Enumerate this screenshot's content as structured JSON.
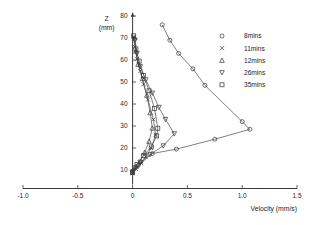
{
  "chart_data": {
    "type": "line",
    "title": "",
    "xlabel": "Velocity  (mm/s)",
    "ylabel": "Z",
    "ylabel_units": "(mm)",
    "xlim": [
      -1.0,
      1.5
    ],
    "ylim": [
      0,
      80
    ],
    "xticks": [
      -1.0,
      -0.5,
      0,
      0.5,
      1.0,
      1.5
    ],
    "xticklabels": [
      "-1.0",
      "-0.5",
      "0",
      "0.5",
      "1.0",
      "1.5"
    ],
    "yticks": [
      10,
      20,
      30,
      40,
      50,
      60,
      70,
      80
    ],
    "yticklabels": [
      "10",
      "20",
      "30",
      "40",
      "50",
      "60",
      "70",
      "80"
    ],
    "grid": false,
    "legend_position": "upper-right",
    "orientation": "x-is-velocity-y-is-height",
    "series": [
      {
        "name": "8mins",
        "marker": "circle",
        "x": [
          0.27,
          0.34,
          0.42,
          0.55,
          0.66,
          1.0,
          1.07,
          0.75,
          0.4,
          0.18,
          0.05,
          0.0
        ],
        "y": [
          76.0,
          69.0,
          63.0,
          56.0,
          48.5,
          32.0,
          28.5,
          24.0,
          19.5,
          17.5,
          12.0,
          9.5
        ]
      },
      {
        "name": "11mins",
        "marker": "cross",
        "x": [
          0.01,
          0.02,
          0.04,
          0.07,
          0.1,
          0.14,
          0.19,
          0.21,
          0.17,
          0.12,
          0.08,
          0.03,
          0.0
        ],
        "y": [
          70.5,
          66.0,
          60.5,
          55.0,
          49.0,
          42.0,
          33.0,
          26.0,
          20.0,
          16.0,
          13.0,
          10.5,
          8.5
        ]
      },
      {
        "name": "12mins",
        "marker": "triangle-up",
        "x": [
          0.02,
          0.03,
          0.05,
          0.09,
          0.13,
          0.16,
          0.18,
          0.15,
          0.11,
          0.07,
          0.03,
          0.0
        ],
        "y": [
          70.0,
          64.0,
          58.0,
          51.5,
          44.0,
          36.0,
          29.0,
          23.0,
          18.0,
          14.0,
          11.5,
          9.0
        ]
      },
      {
        "name": "26mins",
        "marker": "triangle-down",
        "x": [
          0.02,
          0.04,
          0.07,
          0.12,
          0.18,
          0.24,
          0.3,
          0.38,
          0.28,
          0.16,
          0.07,
          0.02,
          0.0
        ],
        "y": [
          69.0,
          63.0,
          57.0,
          51.0,
          45.0,
          38.5,
          33.0,
          26.5,
          21.0,
          17.0,
          13.5,
          11.0,
          9.0
        ]
      },
      {
        "name": "35mins",
        "marker": "square",
        "x": [
          0.01,
          0.03,
          0.06,
          0.1,
          0.15,
          0.2,
          0.23,
          0.22,
          0.17,
          0.1,
          0.04,
          0.0
        ],
        "y": [
          71.0,
          65.0,
          59.5,
          53.0,
          46.0,
          38.0,
          29.0,
          25.5,
          20.5,
          16.5,
          12.5,
          9.0
        ]
      }
    ]
  },
  "legend": {
    "entries": [
      {
        "label": "8mins",
        "marker": "circle"
      },
      {
        "label": "11mins",
        "marker": "cross"
      },
      {
        "label": "12mins",
        "marker": "triangle-up"
      },
      {
        "label": "26mins",
        "marker": "triangle-down"
      },
      {
        "label": "35mins",
        "marker": "square"
      }
    ]
  },
  "colors": {
    "axis": "#3a3a3a",
    "series": "#4a4a4a",
    "background": "#ffffff",
    "text": "#1a1a1a"
  }
}
